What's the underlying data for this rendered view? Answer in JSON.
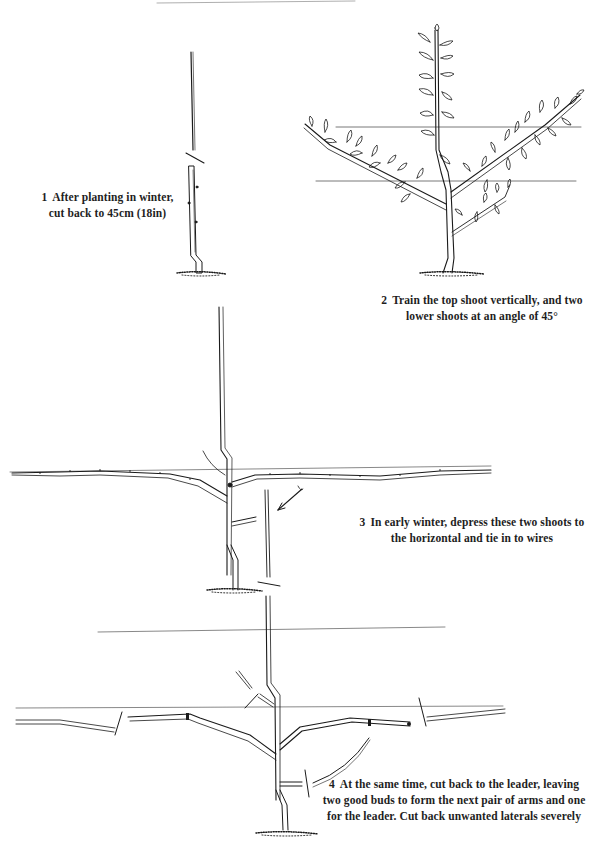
{
  "page": {
    "top_rule": true,
    "line_color": "#1a1a1a",
    "wire_color": "#555555"
  },
  "steps": [
    {
      "number": "1",
      "lines": [
        "After planting in winter,",
        "cut back to 45cm (18in)"
      ],
      "illustration": "maiden-whip-cut-back"
    },
    {
      "number": "2",
      "lines": [
        "Train the top shoot vertically, and two",
        "lower shoots at an angle of 45°"
      ],
      "illustration": "three-shoots-trained-on-wires"
    },
    {
      "number": "3",
      "lines": [
        "In early winter, depress these two shoots to",
        "the horizontal and tie in to wires"
      ],
      "illustration": "first-tier-horizontal-arms"
    },
    {
      "number": "4",
      "lines": [
        "At the same time, cut back to the leader, leaving",
        "two good buds to form the next pair of arms and one",
        "for the leader. Cut back unwanted laterals severely"
      ],
      "illustration": "pruning-second-tier"
    }
  ]
}
